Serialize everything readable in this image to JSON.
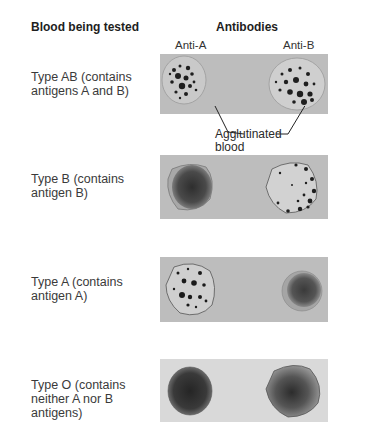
{
  "headers": {
    "blood_tested": "Blood being tested",
    "antibodies": "Antibodies"
  },
  "columns": [
    "Anti-A",
    "Anti-B"
  ],
  "rows": [
    {
      "label": "Type AB (contains antigens A and B)",
      "anti_a": "agglutinated",
      "anti_b": "agglutinated"
    },
    {
      "label": "Type B (contains antigen B)",
      "anti_a": "not agglutinated",
      "anti_b": "agglutinated"
    },
    {
      "label": "Type A (contains antigen A)",
      "anti_a": "agglutinated",
      "anti_b": "not agglutinated"
    },
    {
      "label": "Type O (contains neither A nor B antigens)",
      "anti_a": "not agglutinated",
      "anti_b": "not agglutinated"
    }
  ],
  "callout": {
    "line1": "Agglutinated",
    "line2": "blood"
  },
  "colors": {
    "panel": "#bdbdbd",
    "panel_light": "#d9d9d9",
    "blood_dark": "#3a3a3a",
    "clump": "#1a1a1a"
  }
}
